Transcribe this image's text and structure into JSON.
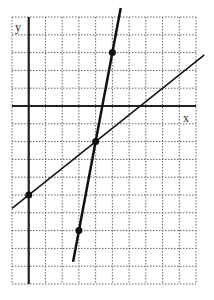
{
  "chart_data": {
    "type": "line",
    "title": "",
    "xlabel": "x",
    "ylabel": "y",
    "grid": true,
    "grid_style": "dotted",
    "xlim": [
      -1,
      10
    ],
    "ylim": [
      -10,
      5
    ],
    "series": [
      {
        "name": "steep line",
        "slope": 5,
        "intercept": -22,
        "points": [
          [
            3,
            -7
          ],
          [
            4,
            -2
          ],
          [
            5,
            3
          ]
        ],
        "x_range": [
          2.65,
          5.5
        ],
        "stroke_width": 2.5
      },
      {
        "name": "shallow line",
        "slope": 0.75,
        "intercept": -5,
        "points": [
          [
            0,
            -5
          ],
          [
            4,
            -2
          ]
        ],
        "x_range": [
          -1,
          10.5
        ],
        "stroke_width": 1.5
      }
    ],
    "marked_points": [
      [
        5,
        3
      ],
      [
        4,
        -2
      ],
      [
        3,
        -7
      ],
      [
        0,
        -5
      ]
    ]
  },
  "labels": {
    "x_axis": "x",
    "y_axis": "y"
  },
  "colors": {
    "line": "#111111",
    "grid": "#666666",
    "axis": "#222222"
  }
}
